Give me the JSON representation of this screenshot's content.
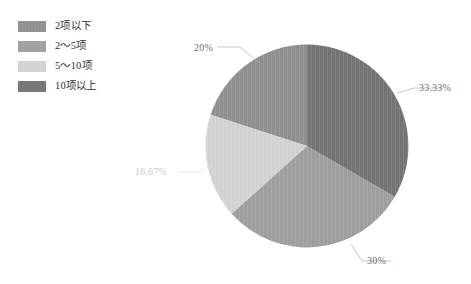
{
  "chart_data": {
    "type": "pie",
    "title": "",
    "legend_position": "top-left",
    "categories": [
      "2项以下",
      "2～5项",
      "5～10项",
      "10项以上"
    ],
    "values": [
      20,
      30,
      16.67,
      33.33
    ],
    "labels": [
      "20%",
      "30%",
      "16.67%",
      "33.33%"
    ],
    "slices": [
      {
        "legend_label": "2项以下",
        "percent_label": "20%",
        "value": 20,
        "color": "#8f8f8f",
        "start_angle": 288,
        "end_angle": 360
      },
      {
        "legend_label": "2～5项",
        "percent_label": "30%",
        "value": 30,
        "color": "#9e9e9e",
        "start_angle": 120,
        "end_angle": 228
      },
      {
        "legend_label": "5～10项",
        "percent_label": "16.67%",
        "value": 16.67,
        "color": "#d2d2d2",
        "start_angle": 228,
        "end_angle": 288
      },
      {
        "legend_label": "10项以上",
        "percent_label": "33.33%",
        "value": 33.33,
        "color": "#737373",
        "start_angle": 0,
        "end_angle": 120
      }
    ]
  },
  "legend": {
    "items": [
      {
        "label": "2项以下",
        "color": "#8f8f8f"
      },
      {
        "label": "2～5项",
        "color": "#9e9e9e"
      },
      {
        "label": "5～10项",
        "color": "#d2d2d2"
      },
      {
        "label": "10项以上",
        "color": "#737373"
      }
    ]
  },
  "callouts": {
    "top_left": "20%",
    "right": "33.33%",
    "bottom": "30%",
    "left": "16.67%"
  },
  "colors": {
    "background": "#ffffff",
    "label_text": "#6f6f6f",
    "label_text_faint": "#c8c8c8",
    "legend_text": "#2e2e2e",
    "leader_line": "#b0b0b0"
  }
}
